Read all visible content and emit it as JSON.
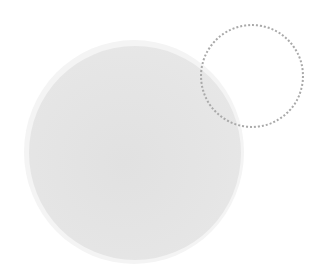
{
  "canvas": {
    "background": "#ffffff",
    "width": 320,
    "height": 279
  },
  "shapes": {
    "large_circle": {
      "fill": "#e5e5e5",
      "halo": "#f4f4f4",
      "center": [
        135,
        152
      ],
      "radius": 107
    },
    "dotted_circle": {
      "stroke": "#a9a9a9",
      "style": "dotted",
      "center": [
        251,
        75
      ],
      "radius": 51
    }
  }
}
